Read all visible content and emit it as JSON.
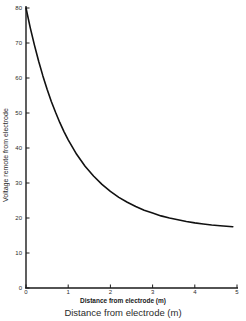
{
  "chart_data": {
    "type": "line",
    "title": "",
    "xlabel": "Distance from electrode (m)",
    "ylabel": "Voltage remote from electrode",
    "xlabel_secondary": "Distance from electrode (m)",
    "xlim": [
      0,
      5
    ],
    "ylim": [
      0,
      80
    ],
    "xticks": [
      0,
      1,
      2,
      3,
      4,
      5
    ],
    "yticks": [
      0,
      10,
      20,
      30,
      40,
      50,
      60,
      70,
      80
    ],
    "xtick_labels": [
      "0",
      "1",
      "2",
      "3",
      "4",
      "5"
    ],
    "ytick_labels": [
      "0",
      "10",
      "20",
      "30",
      "40",
      "50",
      "60",
      "70",
      "80"
    ],
    "grid": false,
    "legend": null,
    "line_color": "#111111",
    "line_width": 1.6,
    "series": [
      {
        "name": "Voltage vs distance",
        "x": [
          0.0,
          0.1,
          0.2,
          0.3,
          0.4,
          0.5,
          0.6,
          0.7,
          0.8,
          0.9,
          1.0,
          1.2,
          1.4,
          1.6,
          1.8,
          2.0,
          2.2,
          2.4,
          2.6,
          2.8,
          3.0,
          3.2,
          3.4,
          3.6,
          3.8,
          4.0,
          4.2,
          4.4,
          4.6,
          4.9
        ],
        "values": [
          80.0,
          74.4,
          69.4,
          64.8,
          60.6,
          56.8,
          53.3,
          50.2,
          47.3,
          44.7,
          42.3,
          38.2,
          34.8,
          32.0,
          29.6,
          27.6,
          25.9,
          24.5,
          23.3,
          22.2,
          21.4,
          20.6,
          20.0,
          19.5,
          19.0,
          18.6,
          18.3,
          18.0,
          17.8,
          17.5
        ]
      }
    ]
  },
  "figure": {
    "background_color": "#ffffff",
    "axis_color": "#1a1a1a"
  }
}
